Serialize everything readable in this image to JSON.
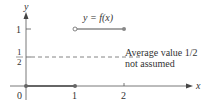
{
  "figure": {
    "function_label": "y = f(x)",
    "annotation_line1": "Average value 1/2",
    "annotation_line2": "not assumed",
    "axes": {
      "x_label": "x",
      "y_label": "y",
      "x_ticks": [
        "0",
        "1",
        "2"
      ],
      "y_tick_1": "1",
      "y_tick_half_num": "1",
      "y_tick_half_den": "2"
    },
    "segments": [
      {
        "from": [
          0,
          0
        ],
        "to": [
          1,
          0
        ],
        "left": "closed",
        "right": "closed"
      },
      {
        "from": [
          1,
          1
        ],
        "to": [
          2,
          1
        ],
        "left": "open",
        "right": "closed"
      }
    ],
    "average_value": 0.5,
    "colors": {
      "axis": "#444444",
      "curve": "#777777",
      "dashed": "#666666"
    }
  }
}
